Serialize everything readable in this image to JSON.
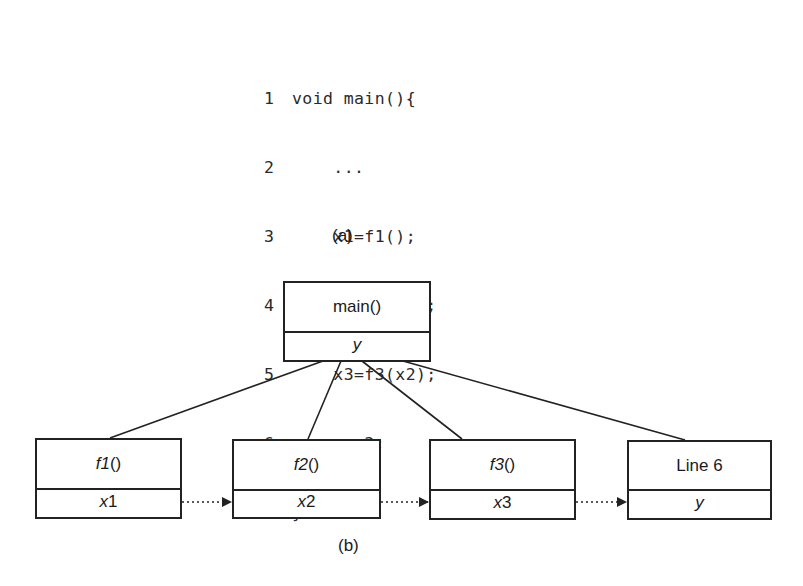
{
  "part_a": {
    "caption": "(a)",
    "code_lines": [
      {
        "num": "1",
        "text": "void main(){"
      },
      {
        "num": "2",
        "text": "    ..."
      },
      {
        "num": "3",
        "text": "    x1=f1();"
      },
      {
        "num": "4",
        "text": "    x2=f2(x1);"
      },
      {
        "num": "5",
        "text": "    x3=f3(x2);"
      },
      {
        "num": "6",
        "text": "    y=x3;"
      },
      {
        "num": "7",
        "text": "}"
      }
    ]
  },
  "part_b": {
    "caption": "(b)",
    "root": {
      "name": "main()",
      "var": "y"
    },
    "children": [
      {
        "fn": "f1",
        "paren": "()",
        "var_name": "x",
        "var_num": "1"
      },
      {
        "fn": "f2",
        "paren": "()",
        "var_name": "x",
        "var_num": "2"
      },
      {
        "fn": "f3",
        "paren": "()",
        "var_name": "x",
        "var_num": "3"
      },
      {
        "label": "Line 6",
        "var": "y"
      }
    ],
    "edges": [
      {
        "from": "main()",
        "to": "f1()",
        "style": "solid"
      },
      {
        "from": "main()",
        "to": "f2()",
        "style": "solid"
      },
      {
        "from": "main()",
        "to": "f3()",
        "style": "solid"
      },
      {
        "from": "main()",
        "to": "Line 6",
        "style": "solid"
      },
      {
        "from": "x1",
        "to": "x2",
        "style": "dotted-arrow"
      },
      {
        "from": "x2",
        "to": "x3",
        "style": "dotted-arrow"
      },
      {
        "from": "x3",
        "to": "y",
        "style": "dotted-arrow"
      }
    ]
  }
}
